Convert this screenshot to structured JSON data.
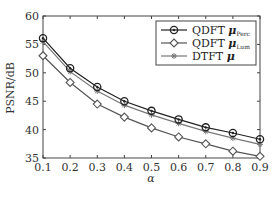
{
  "chart_data": {
    "type": "line",
    "title": "",
    "xlabel": "α",
    "ylabel": "PSNR/dB",
    "x": [
      0.1,
      0.2,
      0.3,
      0.4,
      0.5,
      0.6,
      0.7,
      0.8,
      0.9
    ],
    "x_tick_labels": [
      "0.1",
      "0.2",
      "0.3",
      "0.4",
      "0.5",
      "0.6",
      "0.7",
      "0.8",
      "0.9"
    ],
    "y_tick_labels": [
      "35",
      "40",
      "45",
      "50",
      "55",
      "60"
    ],
    "xlim": [
      0.1,
      0.9
    ],
    "ylim": [
      35,
      60
    ],
    "grid": false,
    "legend_position": "upper right",
    "series": [
      {
        "name": "QDFT μ_Perc",
        "label_main": "QDFT",
        "label_mu": "μ",
        "label_sub": "Perc",
        "marker": "circle",
        "color": "#222222",
        "values": [
          56.1,
          50.8,
          47.5,
          45.0,
          43.3,
          41.8,
          40.4,
          39.4,
          38.3
        ]
      },
      {
        "name": "QDFT μ_Lum",
        "label_main": "QDFT",
        "label_mu": "μ",
        "label_sub": "Lum",
        "marker": "diamond",
        "color": "#555555",
        "values": [
          53.0,
          48.3,
          44.5,
          42.2,
          40.3,
          38.7,
          37.5,
          36.2,
          35.3
        ]
      },
      {
        "name": "DTFT μ",
        "label_main": "DTFT",
        "label_mu": "μ",
        "label_sub": "",
        "marker": "asterisk",
        "color": "#777777",
        "values": [
          55.5,
          50.2,
          46.8,
          44.3,
          42.6,
          41.1,
          39.7,
          38.5,
          37.4
        ]
      }
    ]
  }
}
